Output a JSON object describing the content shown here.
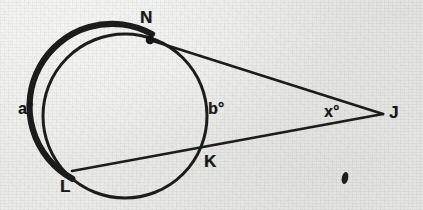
{
  "figure": {
    "kind": "geometry-diagram",
    "background_color": "#eaeae7",
    "ink_color": "#171717",
    "width": 423,
    "height": 210
  },
  "circle": {
    "name": "main-circle",
    "center_x": 125,
    "center_y": 116,
    "radius": 82,
    "stroke_width_thin": 3,
    "stroke_width_thick": 6
  },
  "points": [
    {
      "id": "N",
      "label": "N",
      "x": 150,
      "y": 40,
      "label_x": 140,
      "label_y": 9,
      "dot": true,
      "dot_r": 4.2
    },
    {
      "id": "L",
      "label": "L",
      "x": 73,
      "y": 171,
      "label_x": 60,
      "label_y": 178,
      "dot": false,
      "dot_r": 0
    },
    {
      "id": "K",
      "label": "K",
      "x": 202,
      "y": 147,
      "label_x": 204,
      "label_y": 153,
      "dot": false,
      "dot_r": 0
    },
    {
      "id": "J",
      "label": "J",
      "x": 383,
      "y": 114,
      "label_x": 389,
      "label_y": 104,
      "dot": false,
      "dot_r": 0
    }
  ],
  "angle_labels": [
    {
      "id": "a",
      "label": "a°",
      "x": 18,
      "y": 101,
      "arc": "far arc from L counterclockwise to N"
    },
    {
      "id": "b",
      "label": "b°",
      "x": 208,
      "y": 101,
      "arc": "near arc from N clockwise to K"
    },
    {
      "id": "x",
      "label": "x°",
      "x": 324,
      "y": 104,
      "arc": "angle at external vertex J"
    }
  ],
  "segments": [
    {
      "id": "NJ",
      "from": "N",
      "to": "J",
      "x1": 150,
      "y1": 40,
      "x2": 383,
      "y2": 114,
      "stroke_width": 2.6
    },
    {
      "id": "LJ",
      "from": "L",
      "to": "J",
      "x1": 73,
      "y1": 171,
      "x2": 383,
      "y2": 114,
      "stroke_width": 2.6
    }
  ],
  "arcs": {
    "emphasized": {
      "id": "arc-LN-thick",
      "description": "Bold arc travelling from L counterclockwise around the left of the circle up to N",
      "start_angle_deg": 130,
      "end_angle_deg": 342
    }
  },
  "marks": [
    {
      "id": "ink-blot",
      "label": "",
      "x": 345,
      "y": 178,
      "rx": 3.2,
      "ry": 6.0,
      "rotation_deg": 12
    }
  ]
}
